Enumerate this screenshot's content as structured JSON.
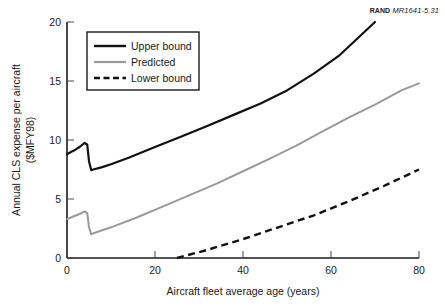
{
  "source_note": {
    "organization": "RAND",
    "document_id": "MR1641-5.31"
  },
  "chart_data": {
    "type": "line",
    "title": "",
    "xlabel": "Aircraft fleet average age (years)",
    "ylabel": "Annual CLS expense per aircraft ($MFY98)",
    "ylabel_line1": "Annual CLS expense per aircraft",
    "ylabel_line2": "($MFY98)",
    "xlim": [
      0,
      80
    ],
    "ylim": [
      0,
      20
    ],
    "xticks": [
      0,
      20,
      40,
      60,
      80
    ],
    "yticks": [
      0,
      5,
      10,
      15,
      20
    ],
    "xtick_labels": [
      "0",
      "20",
      "40",
      "60",
      "80"
    ],
    "ytick_labels": [
      "0",
      "5",
      "10",
      "15",
      "20"
    ],
    "grid": false,
    "legend_position": "upper-left-inside",
    "series": [
      {
        "name": "Upper bound",
        "color": "#111111",
        "style": "solid",
        "x": [
          0,
          1,
          2,
          3,
          4,
          4.6,
          5,
          5.5,
          6,
          8,
          10,
          14,
          20,
          26,
          32,
          38,
          44,
          50,
          56,
          62,
          68,
          70
        ],
        "values": [
          8.8,
          9.0,
          9.2,
          9.45,
          9.75,
          9.6,
          8.2,
          7.45,
          7.5,
          7.7,
          7.95,
          8.5,
          9.4,
          10.3,
          11.2,
          12.15,
          13.1,
          14.2,
          15.6,
          17.2,
          19.3,
          20.0
        ]
      },
      {
        "name": "Predicted",
        "color": "#9a9a9a",
        "style": "solid",
        "x": [
          0,
          1,
          2,
          3,
          4,
          4.6,
          5,
          5.5,
          6,
          8,
          10,
          16,
          22,
          28,
          34,
          40,
          46,
          52,
          58,
          64,
          70,
          76,
          80
        ],
        "values": [
          3.3,
          3.45,
          3.6,
          3.75,
          3.95,
          3.8,
          2.6,
          2.0,
          2.1,
          2.35,
          2.6,
          3.45,
          4.4,
          5.35,
          6.3,
          7.35,
          8.4,
          9.5,
          10.7,
          11.9,
          13.0,
          14.2,
          14.8
        ]
      },
      {
        "name": "Lower bound",
        "color": "#111111",
        "style": "dashed",
        "x": [
          25,
          32,
          40,
          48,
          56,
          64,
          72,
          80
        ],
        "values": [
          0.0,
          0.7,
          1.6,
          2.6,
          3.6,
          4.8,
          6.1,
          7.5
        ]
      }
    ],
    "legend_entries": [
      "Upper bound",
      "Predicted",
      "Lower bound"
    ]
  }
}
